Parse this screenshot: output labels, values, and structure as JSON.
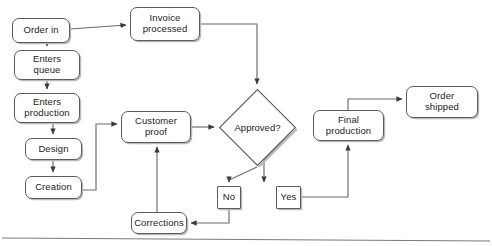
{
  "diagram": {
    "type": "flowchart",
    "colors": {
      "node_fill": "#ffffff",
      "node_stroke": "#5b5b5b",
      "connector": "#6b6b6b",
      "text": "#1b1b1b",
      "shadow": "#b9b9b9"
    },
    "nodes": [
      {
        "id": "order_in",
        "label": "Order in",
        "shape": "rounded-rect",
        "x": 12,
        "y": 18,
        "w": 58,
        "h": 25,
        "font_size": 9.5
      },
      {
        "id": "invoice",
        "label_line1": "Invoice",
        "label_line2": "processed",
        "shape": "rounded-rect",
        "x": 130,
        "y": 7,
        "w": 70,
        "h": 34,
        "font_size": 9.5
      },
      {
        "id": "enters_queue",
        "label_line1": "Enters",
        "label_line2": "queue",
        "shape": "rounded-rect",
        "x": 14,
        "y": 50,
        "w": 66,
        "h": 30,
        "font_size": 9.5
      },
      {
        "id": "enters_production",
        "label_line1": "Enters",
        "label_line2": "production",
        "shape": "rounded-rect",
        "x": 14,
        "y": 93,
        "w": 66,
        "h": 30,
        "font_size": 9.5
      },
      {
        "id": "design",
        "label": "Design",
        "shape": "rounded-rect",
        "x": 25,
        "y": 138,
        "w": 57,
        "h": 22,
        "font_size": 9.5
      },
      {
        "id": "creation",
        "label": "Creation",
        "shape": "rounded-rect",
        "x": 25,
        "y": 176,
        "w": 57,
        "h": 23,
        "font_size": 9.5
      },
      {
        "id": "customer_proof",
        "label_line1": "Customer",
        "label_line2": "proof",
        "shape": "rounded-rect",
        "x": 121,
        "y": 111,
        "w": 70,
        "h": 32,
        "font_size": 9.5
      },
      {
        "id": "approved",
        "label": "Approved?",
        "shape": "diamond",
        "x": 218,
        "y": 88,
        "w": 79,
        "h": 79,
        "font_size": 9.5
      },
      {
        "id": "no",
        "label": "No",
        "shape": "rect",
        "x": 217,
        "y": 186,
        "w": 24,
        "h": 23,
        "font_size": 9.5
      },
      {
        "id": "yes",
        "label": "Yes",
        "shape": "rect",
        "x": 276,
        "y": 186,
        "w": 25,
        "h": 23,
        "font_size": 9.5
      },
      {
        "id": "corrections",
        "label": "Corrections",
        "shape": "rounded-rect",
        "x": 131,
        "y": 212,
        "w": 56,
        "h": 22,
        "font_size": 9.5
      },
      {
        "id": "final_production",
        "label_line1": "Final",
        "label_line2": "production",
        "shape": "rounded-rect",
        "x": 313,
        "y": 110,
        "w": 71,
        "h": 31,
        "font_size": 9.5
      },
      {
        "id": "order_shipped",
        "label_line1": "Order",
        "label_line2": "shipped",
        "shape": "rounded-rect",
        "x": 406,
        "y": 86,
        "w": 72,
        "h": 32,
        "font_size": 9.5
      }
    ],
    "edges": [
      {
        "id": "order_in-to-invoice",
        "from": "order_in",
        "to": "invoice",
        "points": "70,29 126,25",
        "arrow": true
      },
      {
        "id": "order_in-to-enters_queue",
        "from": "order_in",
        "to": "enters_queue",
        "points": "47,43 47,46",
        "arrow": true
      },
      {
        "id": "enters_queue-to-production",
        "from": "enters_queue",
        "to": "enters_production",
        "points": "47,80 47,89",
        "arrow": true
      },
      {
        "id": "production-to-design",
        "from": "enters_production",
        "to": "design",
        "points": "53,123 53,134",
        "arrow": true
      },
      {
        "id": "design-to-creation",
        "from": "design",
        "to": "creation",
        "points": "53,160 53,172",
        "arrow": true
      },
      {
        "id": "creation-to-customer_proof",
        "from": "creation",
        "to": "customer_proof",
        "points": "82,190 96,190 96,124 117,124",
        "arrow": true
      },
      {
        "id": "invoice-to-approved",
        "from": "invoice",
        "to": "approved",
        "points": "200,24 257,24 257,84",
        "arrow": true
      },
      {
        "id": "customer_proof-to-approved",
        "from": "customer_proof",
        "to": "approved",
        "points": "191,127 214,127",
        "arrow": true
      },
      {
        "id": "approved-to-no",
        "from": "approved",
        "to": "no",
        "points": "257,167 229,180 229,182",
        "arrow": true
      },
      {
        "id": "approved-to-yes",
        "from": "approved",
        "to": "yes",
        "points": "290,133 264,160 264,182",
        "arrow": true
      },
      {
        "id": "no-to-corrections",
        "from": "no",
        "to": "corrections",
        "points": "229,209 229,223 191,223",
        "arrow": true
      },
      {
        "id": "corrections-to-customer_proof",
        "from": "corrections",
        "to": "customer_proof",
        "points": "157,212 157,147",
        "arrow": true
      },
      {
        "id": "yes-to-final_production",
        "from": "yes",
        "to": "final_production",
        "points": "301,197 348,197 348,145",
        "arrow": true
      },
      {
        "id": "final_production-to-order_shipped",
        "from": "final_production",
        "to": "order_shipped",
        "points": "348,110 348,99 402,99",
        "arrow": true
      }
    ],
    "page_rule": {
      "id": "bottom-rule",
      "x1": 2,
      "y1": 238,
      "x2": 490,
      "y2": 241
    }
  }
}
